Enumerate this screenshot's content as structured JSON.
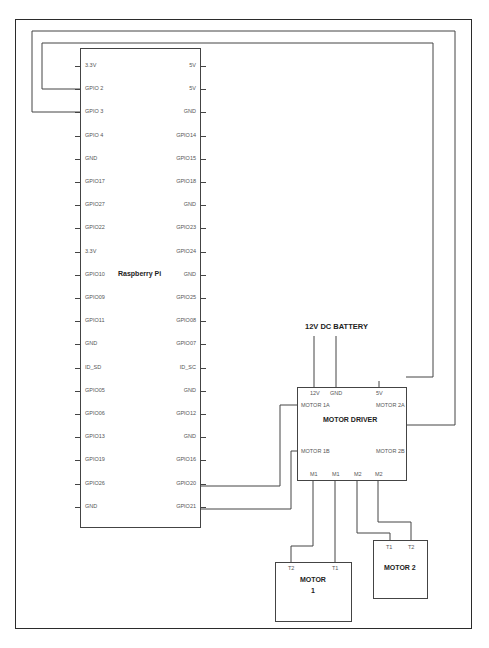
{
  "raspberry_pi": {
    "label": "Raspberry Pi",
    "left_pins": [
      "3.3V",
      "GPIO 2",
      "GPIO 3",
      "GPIO 4",
      "GND",
      "GPIO17",
      "GPIO27",
      "GPIO22",
      "3.3V",
      "GPIO10",
      "GPIO09",
      "GPIO11",
      "GND",
      "ID_SD",
      "GPIO05",
      "GPIO06",
      "GPIO13",
      "GPIO19",
      "GPIO26",
      "GND"
    ],
    "right_pins": [
      "5V",
      "5V",
      "GND",
      "GPIO14",
      "GPIO15",
      "GPIO18",
      "GND",
      "GPIO23",
      "GPIO24",
      "GND",
      "GPIO25",
      "GPIO08",
      "GPIO07",
      "ID_SC",
      "GND",
      "GPIO12",
      "GND",
      "GPIO16",
      "GPIO20",
      "GPIO21"
    ]
  },
  "battery": {
    "label": "12V DC BATTERY"
  },
  "motor_driver": {
    "label": "MOTOR DRIVER",
    "top_pins": [
      "12V",
      "GND",
      "5V"
    ],
    "left_pins": [
      "MOTOR 1A",
      "MOTOR 1B"
    ],
    "right_pins": [
      "MOTOR 2A",
      "MOTOR 2B"
    ],
    "bottom_pins": [
      "M1",
      "M1",
      "M2",
      "M2"
    ]
  },
  "motor1": {
    "label_line1": "MOTOR",
    "label_line2": "1",
    "terminals": [
      "T2",
      "T1"
    ]
  },
  "motor2": {
    "label": "MOTOR 2",
    "terminals": [
      "T1",
      "T2"
    ]
  },
  "connections": [
    {
      "from": "GPIO 2",
      "to": "MOTOR 2A"
    },
    {
      "from": "GPIO 3",
      "to": "MOTOR 2B"
    },
    {
      "from": "GPIO20",
      "to": "MOTOR 1A"
    },
    {
      "from": "GPIO21",
      "to": "MOTOR 1B"
    },
    {
      "from": "12V DC BATTERY",
      "to": "12V"
    },
    {
      "from": "12V DC BATTERY",
      "to": "GND"
    },
    {
      "from": "M1",
      "to": "MOTOR 1 T2"
    },
    {
      "from": "M1",
      "to": "MOTOR 1 T1"
    },
    {
      "from": "M2",
      "to": "MOTOR 2 T1"
    },
    {
      "from": "M2",
      "to": "MOTOR 2 T2"
    }
  ]
}
